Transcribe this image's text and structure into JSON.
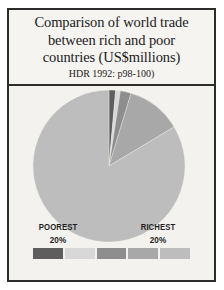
{
  "figure": {
    "title_lines": [
      "Comparison of world trade",
      "between rich and poor",
      "countries (US$millions)"
    ],
    "subtitle": "HDR 1992: p98-100)",
    "border_color": "#2c2c2c",
    "background_color": "#f3f2ee"
  },
  "legend": {
    "left_label": "POOREST",
    "left_percent": "20%",
    "right_label": "RICHEST",
    "right_percent": "20%",
    "swatch_colors": [
      "#5e5e5e",
      "#d8d8d8",
      "#8e8e8e",
      "#a8a8a8",
      "#bdbdbd"
    ]
  },
  "chart_data": {
    "type": "pie",
    "title": "Comparison of world trade between rich and poor countries (US$millions)",
    "subtitle": "HDR 1992: p98-100)",
    "categories": [
      "Poorest 20%",
      "Second 20%",
      "Third 20%",
      "Fourth 20%",
      "Richest 20%"
    ],
    "values": [
      1.4,
      1.0,
      2.3,
      11.7,
      83.6
    ],
    "unit": "percent of world trade",
    "colors": [
      "#5e5e5e",
      "#d8d8d8",
      "#8e8e8e",
      "#a8a8a8",
      "#bdbdbd"
    ],
    "start_angle_deg": -90,
    "direction": "clockwise",
    "legend_position": "bottom",
    "grid": false,
    "labels_shown": [
      "POOREST 20%",
      "RICHEST 20%"
    ],
    "geometry": {
      "center_x": 80,
      "center_y": 80,
      "radius": 76
    }
  }
}
